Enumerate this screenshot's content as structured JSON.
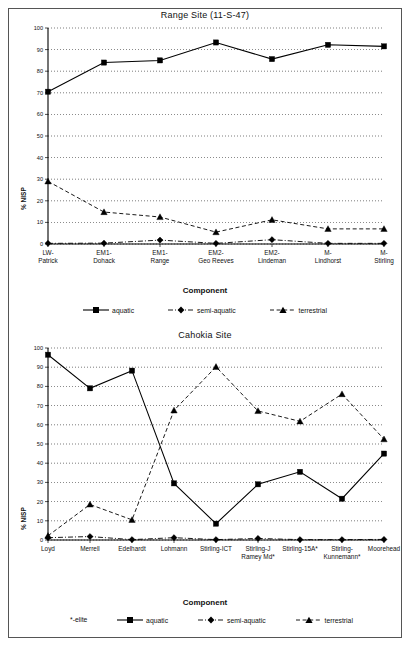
{
  "figure": {
    "background": "#ffffff",
    "ink": "#000000"
  },
  "charts": [
    {
      "id": "range-site",
      "title": "Range Site (11-S-47)",
      "ylabel": "% NISP",
      "xlabel": "Component"
    },
    {
      "id": "cahokia-site",
      "title": "Cahokia Site",
      "ylabel": "% NISP",
      "xlabel": "Component",
      "footnote": "*-elite"
    }
  ],
  "legend": {
    "items": [
      {
        "label": "aquatic",
        "marker": "square",
        "line": "solid"
      },
      {
        "label": "semi-aquatic",
        "marker": "diamond",
        "line": "dash-dot"
      },
      {
        "label": "terrestrial",
        "marker": "triangle",
        "line": "dashed"
      }
    ]
  },
  "chart_data": [
    {
      "type": "line",
      "title": "Range Site (11-S-47)",
      "xlabel": "Component",
      "ylabel": "% NISP",
      "ylim": [
        0,
        100
      ],
      "yticks": [
        0,
        10,
        20,
        30,
        40,
        50,
        60,
        70,
        80,
        90,
        100
      ],
      "grid": true,
      "legend_position": "bottom",
      "categories": [
        "LW-Patrick",
        "EM1-Dohack",
        "EM1-Range",
        "EM2-Geo Reeves",
        "EM2-Lindeman",
        "M-Lindhorst",
        "M-Stirling"
      ],
      "series": [
        {
          "name": "aquatic",
          "values": [
            70.5,
            84.0,
            85.0,
            93.3,
            85.6,
            92.2,
            91.5
          ]
        },
        {
          "name": "semi-aquatic",
          "values": [
            0.3,
            0.4,
            1.8,
            0.3,
            2.0,
            0.3,
            0.3
          ]
        },
        {
          "name": "terrestrial",
          "values": [
            29.0,
            14.8,
            12.5,
            5.5,
            11.2,
            7.0,
            7.0
          ]
        }
      ]
    },
    {
      "type": "line",
      "title": "Cahokia Site",
      "xlabel": "Component",
      "ylabel": "% NISP",
      "ylim": [
        0,
        100
      ],
      "yticks": [
        0,
        10,
        20,
        30,
        40,
        50,
        60,
        70,
        80,
        90,
        100
      ],
      "grid": true,
      "legend_position": "bottom",
      "footnote": "*-elite",
      "categories": [
        "Loyd",
        "Merrell",
        "Edelhardt",
        "Lohmann",
        "Stirling-ICT",
        "Stirling-J Ramey Md*",
        "Stirling-15A*",
        "Stirling-Kunnemann*",
        "Moorehead"
      ],
      "categories_wrapped": [
        [
          "Loyd"
        ],
        [
          "Merrell"
        ],
        [
          "Edelhardt"
        ],
        [
          "Lohmann"
        ],
        [
          "Stirling-ICT"
        ],
        [
          "Stirling-J",
          "Ramey Md*"
        ],
        [
          "Stirling-15A*"
        ],
        [
          "Stirling-",
          "Kunnemann*"
        ],
        [
          "Moorehead"
        ]
      ],
      "series": [
        {
          "name": "aquatic",
          "values": [
            96.5,
            79.0,
            88.2,
            29.5,
            8.5,
            29.0,
            35.5,
            21.5,
            45.0
          ]
        },
        {
          "name": "semi-aquatic",
          "values": [
            1.2,
            1.8,
            0.2,
            1.2,
            0.2,
            0.8,
            0.2,
            0.2,
            0.3
          ]
        },
        {
          "name": "terrestrial",
          "values": [
            2.2,
            18.5,
            10.5,
            67.5,
            90.2,
            67.2,
            61.8,
            76.0,
            52.5
          ]
        }
      ]
    }
  ]
}
